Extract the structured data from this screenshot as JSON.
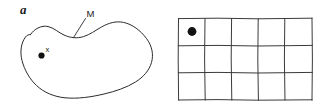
{
  "figure": {
    "panels": [
      {
        "id": "a",
        "label": "a",
        "kind": "continuous-manifold",
        "description": "Smooth closed blob curve representing a manifold M with a marked interior point x",
        "shape_label": "M",
        "point_label": "x",
        "point_marker": "filled-dot"
      },
      {
        "id": "b",
        "label": "b",
        "kind": "discrete-lattice",
        "description": "Rectangular grid of cells with a filled dot marking the top-left cell",
        "grid": {
          "columns": 5,
          "rows": 3,
          "marked_cell": {
            "row": 1,
            "column": 1
          },
          "point_marker": "filled-dot"
        }
      }
    ],
    "colors": {
      "background": "#ffffff",
      "ink": "#2b2b2b",
      "grid_ink": "#3a3a3a",
      "marker": "#111111",
      "text": "#1a1a1a"
    }
  }
}
